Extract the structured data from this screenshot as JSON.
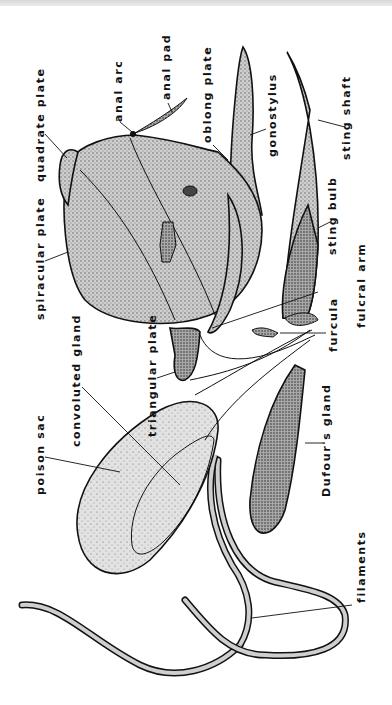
{
  "figure": {
    "orientation": "rotated 90° counter-clockwise; labels read bottom-to-top",
    "colors": {
      "ink": "#111111",
      "stipple_dark": "#8a8a8a",
      "stipple_light": "#c8c8c8",
      "background": "#ffffff"
    }
  },
  "labels": [
    {
      "id": "quadrate-plate",
      "text": "quadrate plate"
    },
    {
      "id": "anal-arc",
      "text": "anal arc"
    },
    {
      "id": "anal-pad",
      "text": "anal pad"
    },
    {
      "id": "oblong-plate",
      "text": "oblong plate"
    },
    {
      "id": "gonostylus",
      "text": "gonostylus"
    },
    {
      "id": "sting-shaft",
      "text": "sting shaft"
    },
    {
      "id": "spiracular-plate",
      "text": "spiracular plate"
    },
    {
      "id": "sting-bulb",
      "text": "sting bulb"
    },
    {
      "id": "fulcral-arm",
      "text": "fulcral arm"
    },
    {
      "id": "furcula",
      "text": "furcula"
    },
    {
      "id": "triangular-plate",
      "text": "triangular plate"
    },
    {
      "id": "convoluted-gland",
      "text": "convoluted gland"
    },
    {
      "id": "poison-sac",
      "text": "poison sac"
    },
    {
      "id": "dufours-gland",
      "text": "Dufour's gland"
    },
    {
      "id": "filaments",
      "text": "filaments"
    }
  ]
}
